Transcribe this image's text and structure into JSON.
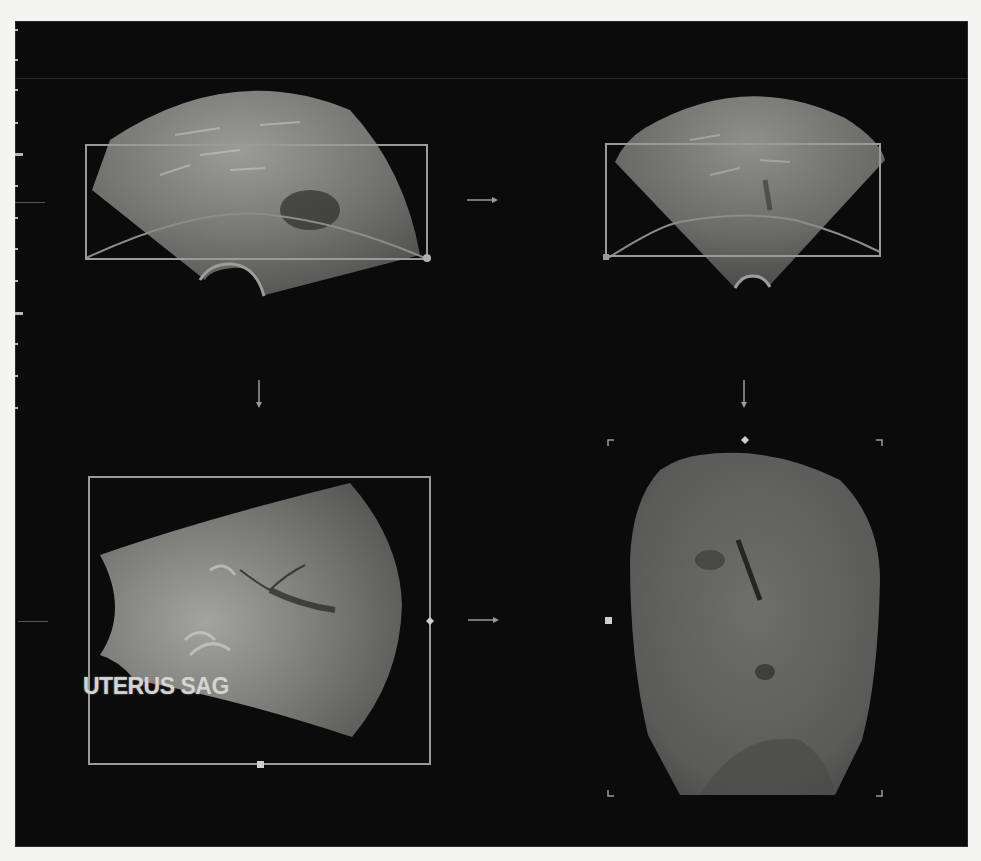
{
  "figure": {
    "annotation_label": "UTERUS SAG",
    "colors": {
      "background_page": "#f4f4f2",
      "panel_background": "#0b0b0b",
      "roi_box": "#9a9a96",
      "handle": "#cfcfc9",
      "tissue_light": "#8e8e8a",
      "tissue_dark": "#3c3c3a"
    },
    "panels": [
      {
        "id": "top-left",
        "description": "sagittal sector ultrasound with ROI box"
      },
      {
        "id": "top-right",
        "description": "transverse sector ultrasound with ROI box"
      },
      {
        "id": "bottom-left",
        "description": "rotated sagittal sector with ROI box and UTERUS SAG label"
      },
      {
        "id": "bottom-right",
        "description": "rendered 3D coronal view of uterus"
      }
    ],
    "arrows": [
      {
        "from": "top-left",
        "to": "top-right",
        "direction": "right"
      },
      {
        "from": "top-left",
        "to": "bottom-left",
        "direction": "down"
      },
      {
        "from": "top-right",
        "to": "bottom-right",
        "direction": "down"
      },
      {
        "from": "bottom-left",
        "to": "bottom-right",
        "direction": "right"
      }
    ]
  }
}
